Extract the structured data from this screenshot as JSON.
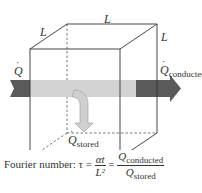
{
  "labels": {
    "L_top": "L",
    "L_left": "L",
    "L_right": "L",
    "Q_in": "Q",
    "Q_conducted_main": "Q",
    "Q_conducted_sub": "conducted",
    "Q_stored_main": "Q",
    "Q_stored_sub": "stored"
  },
  "formula": {
    "prefix": "Fourier number: τ =",
    "frac1_num": "αt",
    "frac1_den": "L²",
    "equals": "=",
    "frac2_num_main": "Q",
    "frac2_num_sub": "conducted",
    "frac2_den_main": "Q",
    "frac2_den_sub": "stored"
  },
  "colors": {
    "arrow_dark": "#5a5a5a",
    "arrow_light": "#d3d3d3",
    "lines": "#333333"
  }
}
